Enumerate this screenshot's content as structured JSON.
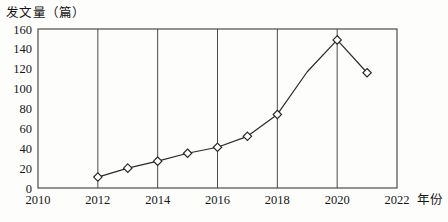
{
  "chart_data": {
    "type": "line",
    "title": "发文量（篇）",
    "xlabel": "年份",
    "ylabel": "发文量（篇）",
    "x": [
      2012,
      2013,
      2014,
      2015,
      2016,
      2017,
      2018,
      2019,
      2020,
      2021
    ],
    "values": [
      11,
      20,
      27,
      35,
      41,
      52,
      74,
      117,
      149,
      116
    ],
    "series": [
      {
        "name": "发文量",
        "values": [
          11,
          20,
          27,
          35,
          41,
          52,
          74,
          117,
          149,
          116
        ]
      }
    ],
    "marker": "diamond",
    "marker_years": [
      2012,
      2013,
      2014,
      2015,
      2016,
      2017,
      2018,
      2020,
      2021
    ],
    "xlim": [
      2010,
      2022
    ],
    "ylim": [
      0,
      160
    ],
    "xticks": [
      2010,
      2012,
      2014,
      2016,
      2018,
      2020,
      2022
    ],
    "xtick_labels": [
      "2010",
      "2012",
      "2014",
      "2016",
      "2018",
      "2020",
      "2022"
    ],
    "yticks": [
      0,
      20,
      40,
      60,
      80,
      100,
      120,
      140,
      160
    ],
    "ytick_labels": [
      "0",
      "20",
      "40",
      "60",
      "80",
      "100",
      "120",
      "140",
      "160"
    ],
    "gridlines_x": [
      2012,
      2014,
      2016,
      2018,
      2020
    ],
    "grid": "vertical-only",
    "legend": "none",
    "colors": {
      "line": "#2a2a2a",
      "marker_fill": "#ffffff",
      "frame": "#3c3c3c",
      "grid": "#4a4a4a",
      "background": "#fdfdfc"
    }
  }
}
